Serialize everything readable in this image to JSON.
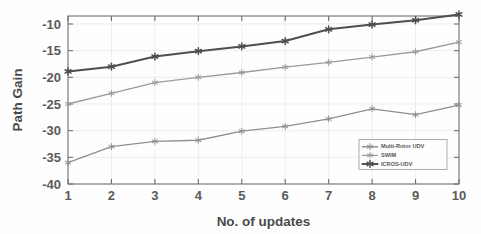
{
  "chart_data": {
    "type": "line",
    "title": "",
    "xlabel": "No. of updates",
    "ylabel": "Path Gain",
    "x": [
      1,
      2,
      3,
      4,
      5,
      6,
      7,
      8,
      9,
      10
    ],
    "categories": [
      "1",
      "2",
      "3",
      "4",
      "5",
      "6",
      "7",
      "8",
      "9",
      "10"
    ],
    "xlim": [
      1,
      10
    ],
    "ylim": [
      -40,
      -8
    ],
    "ytick_labels": [
      "-10",
      "-15",
      "-20",
      "-25",
      "-30",
      "-35",
      "-40"
    ],
    "ytick_values": [
      -10,
      -15,
      -20,
      -25,
      -30,
      -35,
      -40
    ],
    "xtick_labels": [
      "1",
      "2",
      "3",
      "4",
      "5",
      "6",
      "7",
      "8",
      "9",
      "10"
    ],
    "grid": true,
    "legend_position": "lower right",
    "series": [
      {
        "name": "Multi-Rotor UDV",
        "color": "#8f8f8f",
        "marker": "star",
        "values": [
          -36.0,
          -33.0,
          -32.0,
          -31.8,
          -30.1,
          -29.2,
          -27.8,
          -25.9,
          -27.0,
          -25.2
        ]
      },
      {
        "name": "SWIM",
        "color": "#9a9a9a",
        "marker": "star",
        "values": [
          -25.0,
          -23.0,
          -21.0,
          -20.0,
          -19.1,
          -18.1,
          -17.2,
          -16.2,
          -15.2,
          -13.4
        ]
      },
      {
        "name": "ICROS-UDV",
        "color": "#4f4f4f",
        "marker": "star",
        "values": [
          -18.9,
          -18.0,
          -16.1,
          -15.1,
          -14.2,
          -13.2,
          -11.0,
          -10.1,
          -9.3,
          -8.2
        ]
      }
    ]
  },
  "axes": {
    "y_title": "Path Gain",
    "x_title": "No. of updates"
  },
  "legend": {
    "entries": [
      {
        "label": "Multi-Rotor UDV"
      },
      {
        "label": "SWIM"
      },
      {
        "label": "ICROS-UDV"
      }
    ]
  },
  "colors": {
    "series_dark": "#4f4f4f",
    "series_mid": "#9a9a9a",
    "series_light": "#8f8f8f",
    "axis": "#6e6e6e",
    "grid": "#e6e6e6",
    "text": "#5a5a5a",
    "background": "#fefefe"
  }
}
